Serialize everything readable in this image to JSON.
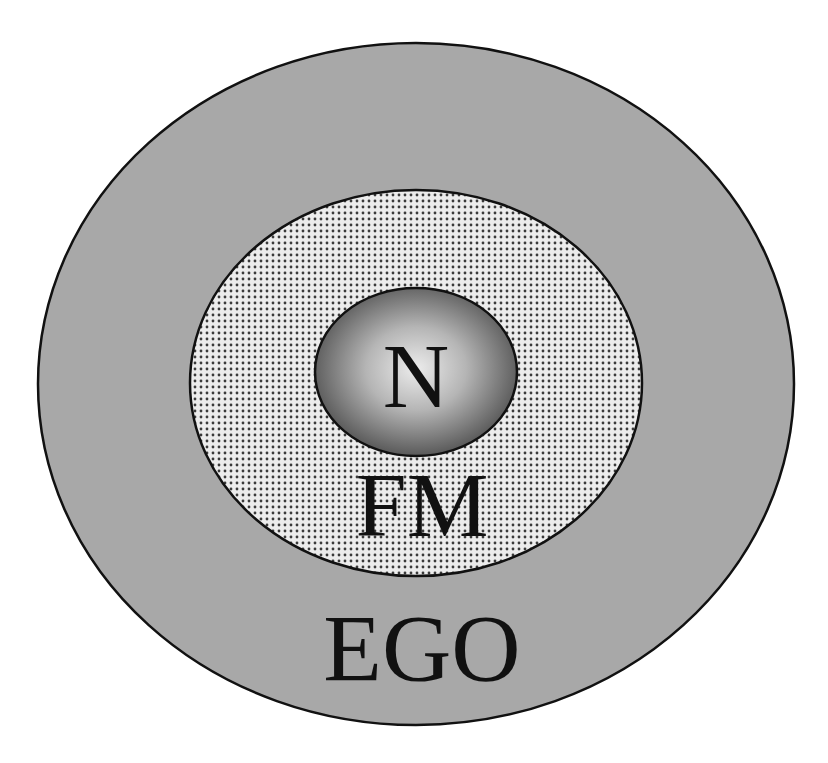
{
  "diagram": {
    "type": "nested-ellipses",
    "layers": [
      {
        "id": "outer",
        "label": "EGO",
        "fill": "#a6a6a6",
        "stroke": "#111111",
        "pattern": "solid"
      },
      {
        "id": "middle",
        "label": "FM",
        "fill": "#e6e6e6",
        "stroke": "#111111",
        "pattern": "dots",
        "dot_color": "#444444"
      },
      {
        "id": "inner",
        "label": "N",
        "fill_center": "#e8e8e8",
        "fill_edge": "#555555",
        "stroke": "#111111",
        "pattern": "radial-gradient"
      }
    ]
  }
}
